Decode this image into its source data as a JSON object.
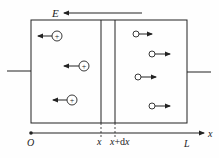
{
  "diagram": {
    "field_label": "E",
    "axis_label": "x",
    "origin_label": "O",
    "end_label": "L",
    "slice_left_label": "x",
    "slice_right_label_var": "x",
    "slice_right_label_plus": "+d",
    "slice_right_label_var2": "x",
    "positive_ions": [
      {
        "cx": 57,
        "cy": 36,
        "symbol": "+",
        "direction": "left"
      },
      {
        "cx": 84,
        "cy": 66,
        "symbol": "+",
        "direction": "left"
      },
      {
        "cx": 72,
        "cy": 100,
        "symbol": "+",
        "direction": "left"
      }
    ],
    "negative_carriers": [
      {
        "cx": 136,
        "cy": 34,
        "direction": "right"
      },
      {
        "cx": 152,
        "cy": 54,
        "direction": "right"
      },
      {
        "cx": 138,
        "cy": 77,
        "direction": "right"
      },
      {
        "cx": 152,
        "cy": 106,
        "direction": "right"
      }
    ],
    "colors": {
      "line": "#222222",
      "background": "#ffffff"
    }
  }
}
